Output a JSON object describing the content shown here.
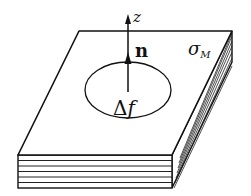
{
  "figure": {
    "labels": {
      "z_axis": "z",
      "normal_vector": "n",
      "surface_charge_symbol": "σ",
      "surface_charge_subscript": "M",
      "area_element_delta": "Δ",
      "area_element_var": "f"
    },
    "layers_count": 6,
    "colors": {
      "stroke": "#111111",
      "background": "#ffffff"
    }
  }
}
